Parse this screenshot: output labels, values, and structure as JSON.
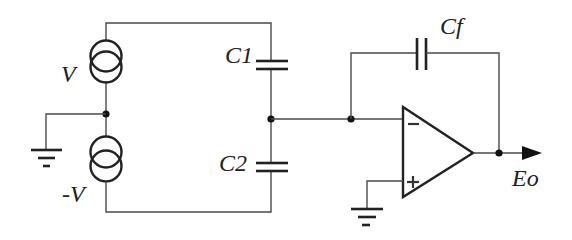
{
  "diagram": {
    "type": "circuit-schematic",
    "labels": {
      "source_top": "V",
      "source_bottom": "-V",
      "capacitor_1": "C1",
      "capacitor_2": "C2",
      "feedback_capacitor": "Cf",
      "output": "Eo"
    },
    "opamp_inputs": {
      "inverting": "−",
      "non_inverting": "+"
    },
    "colors": {
      "line": "#4a4a4a",
      "ink": "#222222",
      "background": "#ffffff"
    }
  }
}
